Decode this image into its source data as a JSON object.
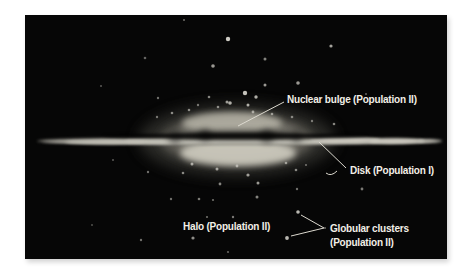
{
  "labels": {
    "nuclear_bulge": "Nuclear bulge (Population II)",
    "disk": "Disk (Population I)",
    "halo": "Halo (Population II)",
    "globular_line1": "Globular clusters",
    "globular_line2": "(Population II)"
  },
  "colors": {
    "page_background": "#ffffff",
    "space_background": "#060606",
    "label_text": "#f2efe6",
    "leader_line": "#dcd9cf",
    "star": "#d9d7cf"
  },
  "stars": [
    [
      184,
      20,
      1,
      0.5
    ],
    [
      228,
      39,
      2.2,
      0.95
    ],
    [
      145,
      58,
      1.3,
      0.45
    ],
    [
      213,
      66,
      1.8,
      0.7
    ],
    [
      265,
      59,
      1.5,
      0.6
    ],
    [
      331,
      46,
      1.6,
      0.75
    ],
    [
      298,
      83,
      1.8,
      0.7
    ],
    [
      366,
      94,
      1,
      0.45
    ],
    [
      101,
      86,
      1,
      0.4
    ],
    [
      245,
      93,
      2.2,
      0.9
    ],
    [
      256,
      97,
      1.7,
      0.8
    ],
    [
      265,
      85,
      1.5,
      0.7
    ],
    [
      209,
      97,
      1.3,
      0.6
    ],
    [
      227,
      102,
      1.5,
      0.7
    ],
    [
      248,
      105,
      1.5,
      0.8
    ],
    [
      158,
      98,
      1.2,
      0.5
    ],
    [
      198,
      105,
      1.2,
      0.5
    ],
    [
      218,
      107,
      1.3,
      0.6
    ],
    [
      230,
      103,
      1.8,
      0.8
    ],
    [
      253,
      112,
      1.4,
      0.65
    ],
    [
      272,
      114,
      1.3,
      0.6
    ],
    [
      292,
      117,
      1.3,
      0.55
    ],
    [
      312,
      121,
      1.2,
      0.5
    ],
    [
      334,
      124,
      1.3,
      0.6
    ],
    [
      172,
      113,
      1.3,
      0.6
    ],
    [
      157,
      117,
      1.2,
      0.5
    ],
    [
      189,
      110,
      1.3,
      0.6
    ],
    [
      148,
      172,
      1.2,
      0.5
    ],
    [
      192,
      164,
      1.5,
      0.7
    ],
    [
      183,
      173,
      1.3,
      0.6
    ],
    [
      217,
      169,
      1.5,
      0.7
    ],
    [
      237,
      166,
      1.4,
      0.65
    ],
    [
      248,
      175,
      1.6,
      0.7
    ],
    [
      220,
      184,
      1.4,
      0.6
    ],
    [
      258,
      183,
      1.5,
      0.7
    ],
    [
      286,
      163,
      1.3,
      0.6
    ],
    [
      296,
      170,
      1.3,
      0.6
    ],
    [
      306,
      165,
      1,
      0.5
    ],
    [
      257,
      197,
      1.5,
      0.6
    ],
    [
      199,
      199,
      1.3,
      0.55
    ],
    [
      171,
      199,
      1.2,
      0.5
    ],
    [
      297,
      189,
      1.2,
      0.5
    ],
    [
      362,
      189,
      1.4,
      0.55
    ],
    [
      213,
      200,
      1.1,
      0.5
    ],
    [
      233,
      217,
      1.2,
      0.55
    ],
    [
      207,
      217,
      1.1,
      0.5
    ],
    [
      193,
      238,
      1.6,
      0.65
    ],
    [
      92,
      225,
      1,
      0.35
    ],
    [
      141,
      240,
      1.2,
      0.5
    ],
    [
      228,
      252,
      1.1,
      0.45
    ],
    [
      325,
      228,
      1,
      0.5
    ],
    [
      298,
      212,
      1.8,
      0.85
    ],
    [
      287,
      238,
      1.9,
      0.85
    ],
    [
      113,
      160,
      1,
      0.4
    ]
  ],
  "image_offset": {
    "x": 25,
    "y": 15
  }
}
